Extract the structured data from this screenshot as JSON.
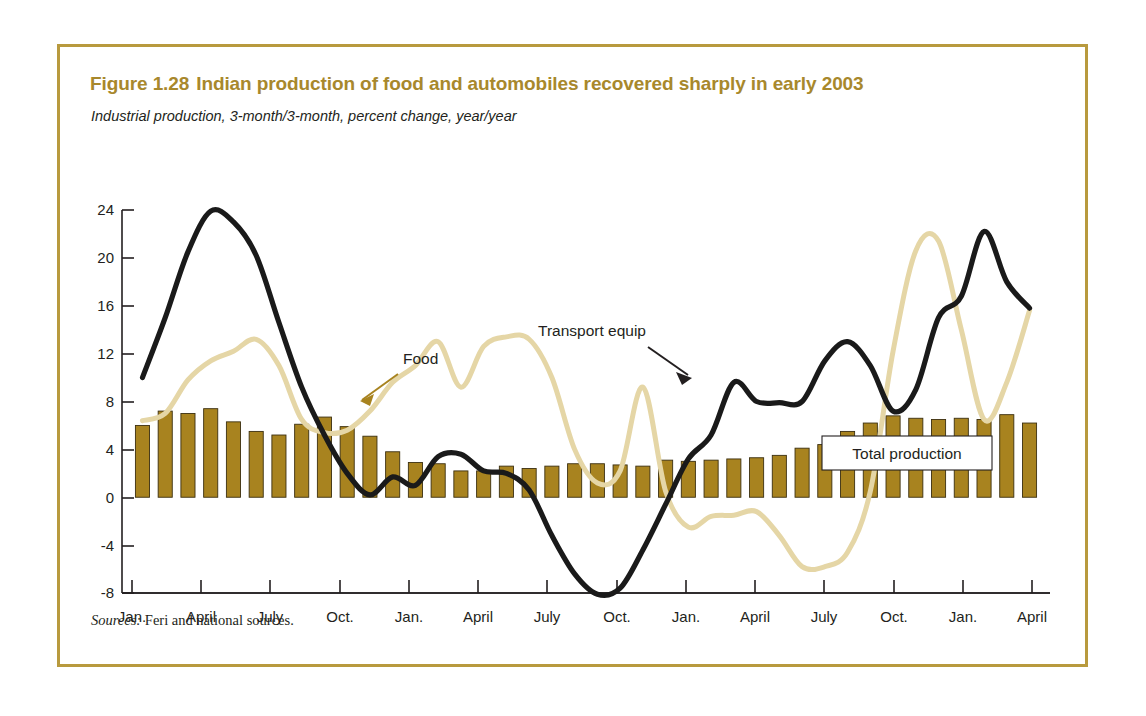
{
  "figure": {
    "number": "Figure 1.28",
    "title": "Indian production of food and automobiles recovered sharply in early 2003",
    "subtitle": "Industrial production, 3-month/3-month, percent change, year/year",
    "sources_label": "Sources:",
    "sources_text": "Feri and national sources.",
    "border_color": "#b89a3e",
    "title_color": "#a8882c"
  },
  "annotations": {
    "food": "Food",
    "transport": "Transport equip",
    "total": "Total production"
  },
  "chart_data": {
    "type": "bar",
    "title": "Indian production of food and automobiles recovered sharply in early 2003",
    "subtitle": "Industrial production, 3-month/3-month, percent change, year/year",
    "xlabel": "",
    "ylabel": "percent change",
    "ylim": [
      -8,
      24
    ],
    "yticks": [
      24,
      20,
      16,
      12,
      8,
      4,
      0,
      -4,
      -8
    ],
    "grid": false,
    "legend_position": "inline-annotations",
    "xtick_labels": [
      {
        "month": "Jan.",
        "year": "2000"
      },
      {
        "month": "April",
        "year": "2000"
      },
      {
        "month": "July",
        "year": "2000"
      },
      {
        "month": "Oct.",
        "year": "2000"
      },
      {
        "month": "Jan.",
        "year": "2001"
      },
      {
        "month": "April",
        "year": "2001"
      },
      {
        "month": "July",
        "year": "2001"
      },
      {
        "month": "Oct.",
        "year": "2001"
      },
      {
        "month": "Jan.",
        "year": "2002"
      },
      {
        "month": "April",
        "year": "2002"
      },
      {
        "month": "July",
        "year": "2002"
      },
      {
        "month": "Oct.",
        "year": "2002"
      },
      {
        "month": "Jan.",
        "year": "2003"
      },
      {
        "month": "April",
        "year": "2003"
      }
    ],
    "x_months": [
      "2000-01",
      "2000-02",
      "2000-03",
      "2000-04",
      "2000-05",
      "2000-06",
      "2000-07",
      "2000-08",
      "2000-09",
      "2000-10",
      "2000-11",
      "2000-12",
      "2001-01",
      "2001-02",
      "2001-03",
      "2001-04",
      "2001-05",
      "2001-06",
      "2001-07",
      "2001-08",
      "2001-09",
      "2001-10",
      "2001-11",
      "2001-12",
      "2002-01",
      "2002-02",
      "2002-03",
      "2002-04",
      "2002-05",
      "2002-06",
      "2002-07",
      "2002-08",
      "2002-09",
      "2002-10",
      "2002-11",
      "2002-12",
      "2003-01",
      "2003-02",
      "2003-03",
      "2003-04"
    ],
    "series": [
      {
        "name": "Total production",
        "kind": "bar",
        "color": "#a8831f",
        "values": [
          6.0,
          7.2,
          7.0,
          7.4,
          6.3,
          5.5,
          5.2,
          6.1,
          6.7,
          5.9,
          5.1,
          3.8,
          2.9,
          2.8,
          2.2,
          2.2,
          2.6,
          2.4,
          2.6,
          2.8,
          2.8,
          2.7,
          2.6,
          3.1,
          3.0,
          3.1,
          3.2,
          3.3,
          3.5,
          4.1,
          4.4,
          5.5,
          6.2,
          6.8,
          6.6,
          6.5,
          6.6,
          6.5,
          6.9,
          6.2
        ]
      },
      {
        "name": "Food",
        "kind": "line",
        "color": "#e5d6a6",
        "values": [
          6.4,
          7.0,
          9.8,
          11.4,
          12.2,
          13.2,
          11.0,
          6.5,
          5.4,
          5.6,
          7.2,
          9.6,
          11.0,
          13.0,
          9.2,
          12.6,
          13.4,
          13.2,
          10.0,
          4.0,
          1.2,
          2.2,
          9.2,
          0.5,
          -2.5,
          -1.6,
          -1.5,
          -1.2,
          -3.2,
          -5.8,
          -5.8,
          -4.6,
          0.5,
          12.2,
          20.6,
          21.4,
          14.0,
          6.5,
          9.6,
          15.6
        ]
      },
      {
        "name": "Transport equip",
        "kind": "line",
        "color": "#1a1a1a",
        "values": [
          10.0,
          15.0,
          20.5,
          23.9,
          23.0,
          20.2,
          14.6,
          9.2,
          5.2,
          2.0,
          0.2,
          1.7,
          1.0,
          3.4,
          3.6,
          2.2,
          2.0,
          0.6,
          -3.2,
          -6.4,
          -8.1,
          -7.6,
          -4.4,
          -0.6,
          3.2,
          5.2,
          9.6,
          8.0,
          7.9,
          8.0,
          11.4,
          13.0,
          11.0,
          7.2,
          9.0,
          15.0,
          16.8,
          22.2,
          18.0,
          15.8
        ]
      }
    ]
  }
}
